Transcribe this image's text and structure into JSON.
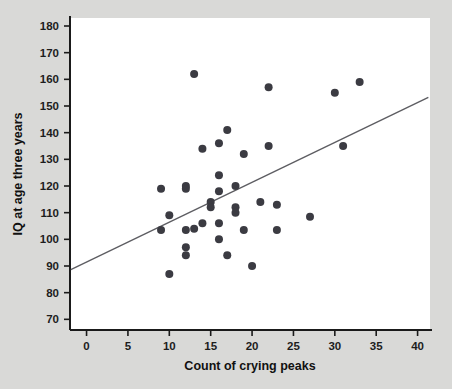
{
  "figure": {
    "background_color": "#d9d9d7",
    "plot_background_color": "#ffffff"
  },
  "chart_data": {
    "type": "scatter",
    "title": "",
    "xlabel": "Count of crying peaks",
    "ylabel": "IQ at age three years",
    "xlim": [
      -2,
      41.5
    ],
    "ylim": [
      66,
      183
    ],
    "xticks": [
      0,
      5,
      10,
      15,
      20,
      25,
      30,
      35,
      40
    ],
    "yticks": [
      70,
      80,
      90,
      100,
      110,
      120,
      130,
      140,
      150,
      160,
      170,
      180
    ],
    "xtick_labels": [
      "0",
      "5",
      "10",
      "15",
      "20",
      "25",
      "30",
      "35",
      "40"
    ],
    "ytick_labels": [
      "70",
      "80",
      "90",
      "100",
      "110",
      "120",
      "130",
      "140",
      "150",
      "160",
      "170",
      "180"
    ],
    "grid": false,
    "legend": null,
    "marker_color": "#3b3b42",
    "marker_size": 4,
    "points": [
      {
        "x": 9,
        "y": 119
      },
      {
        "x": 9,
        "y": 103.5
      },
      {
        "x": 10,
        "y": 109
      },
      {
        "x": 10,
        "y": 87
      },
      {
        "x": 12,
        "y": 120
      },
      {
        "x": 12,
        "y": 119
      },
      {
        "x": 12,
        "y": 103.5
      },
      {
        "x": 12,
        "y": 97
      },
      {
        "x": 12,
        "y": 94
      },
      {
        "x": 13,
        "y": 162
      },
      {
        "x": 13,
        "y": 104
      },
      {
        "x": 14,
        "y": 134
      },
      {
        "x": 14,
        "y": 106
      },
      {
        "x": 15,
        "y": 114
      },
      {
        "x": 15,
        "y": 112
      },
      {
        "x": 16,
        "y": 136
      },
      {
        "x": 16,
        "y": 124
      },
      {
        "x": 16,
        "y": 118
      },
      {
        "x": 16,
        "y": 106
      },
      {
        "x": 16,
        "y": 100
      },
      {
        "x": 17,
        "y": 141
      },
      {
        "x": 17,
        "y": 94
      },
      {
        "x": 18,
        "y": 112
      },
      {
        "x": 18,
        "y": 110
      },
      {
        "x": 18,
        "y": 120
      },
      {
        "x": 19,
        "y": 132
      },
      {
        "x": 19,
        "y": 103.5
      },
      {
        "x": 20,
        "y": 90
      },
      {
        "x": 21,
        "y": 114
      },
      {
        "x": 22,
        "y": 157
      },
      {
        "x": 22,
        "y": 135
      },
      {
        "x": 23,
        "y": 113
      },
      {
        "x": 23,
        "y": 103.5
      },
      {
        "x": 27,
        "y": 108.5
      },
      {
        "x": 30,
        "y": 155
      },
      {
        "x": 31,
        "y": 135
      },
      {
        "x": 33,
        "y": 159
      }
    ],
    "trendline": {
      "type": "linear",
      "color": "#5d5d62",
      "x_start": -1.9,
      "y_start": 88.6,
      "x_end": 41.3,
      "y_end": 153.2
    }
  }
}
